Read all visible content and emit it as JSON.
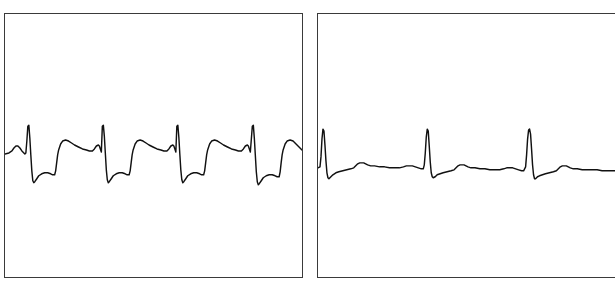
{
  "figure": {
    "type": "ecg-comparison-figure",
    "background_color": "#ffffff",
    "panel_border_color": "#3a3a3a",
    "trace_color": "#111111",
    "panel_count": 2
  },
  "panels": [
    {
      "id": "left",
      "name": "ecg-strip-left",
      "rhythm_label": "",
      "beat_count": 4,
      "frame": {
        "x": 4,
        "y": 13,
        "width": 299,
        "height": 265
      }
    },
    {
      "id": "right",
      "name": "ecg-strip-right",
      "rhythm_label": "",
      "beat_count": 3,
      "frame": {
        "x": 317,
        "y": 13,
        "width": 299,
        "height": 265
      }
    }
  ],
  "chart_data": [
    {
      "type": "line",
      "id": "ecg-left",
      "title": "",
      "xlabel": "",
      "ylabel": "",
      "grid": false,
      "legend": false,
      "xlim": [
        0,
        299
      ],
      "ylim": [
        0,
        265
      ],
      "baseline_y": 140,
      "beat_interval_px": 75,
      "r_peak_x": [
        23,
        98,
        173,
        249
      ],
      "r_peak_y": 113,
      "s_trough_y": 170,
      "t_peak_y": 128,
      "series": [
        {
          "name": "ecg-waveform-left",
          "points": [
            [
              0,
              141
            ],
            [
              4,
              140
            ],
            [
              7,
              138
            ],
            [
              9,
              135
            ],
            [
              11,
              133
            ],
            [
              13,
              133
            ],
            [
              15,
              135
            ],
            [
              17,
              138
            ],
            [
              19,
              140
            ],
            [
              20,
              141
            ],
            [
              21,
              140
            ],
            [
              22,
              128
            ],
            [
              23,
              113
            ],
            [
              24,
              112
            ],
            [
              25,
              125
            ],
            [
              26,
              142
            ],
            [
              27,
              158
            ],
            [
              28,
              168
            ],
            [
              29,
              170
            ],
            [
              30,
              169
            ],
            [
              32,
              166
            ],
            [
              34,
              163
            ],
            [
              37,
              161
            ],
            [
              40,
              160
            ],
            [
              43,
              160
            ],
            [
              46,
              161
            ],
            [
              48,
              162
            ],
            [
              50,
              162
            ],
            [
              51,
              158
            ],
            [
              52,
              150
            ],
            [
              53,
              142
            ],
            [
              54,
              137
            ],
            [
              56,
              131
            ],
            [
              58,
              128
            ],
            [
              61,
              127
            ],
            [
              64,
              128
            ],
            [
              67,
              130
            ],
            [
              70,
              132
            ],
            [
              74,
              134
            ],
            [
              78,
              136
            ],
            [
              82,
              137
            ],
            [
              85,
              138
            ],
            [
              88,
              138
            ],
            [
              90,
              136
            ],
            [
              92,
              133
            ],
            [
              94,
              132
            ],
            [
              95,
              133
            ],
            [
              96,
              136
            ],
            [
              97,
              139
            ],
            [
              98,
              113
            ],
            [
              99,
              112
            ],
            [
              100,
              123
            ],
            [
              101,
              140
            ],
            [
              102,
              157
            ],
            [
              103,
              167
            ],
            [
              104,
              170
            ],
            [
              105,
              169
            ],
            [
              107,
              166
            ],
            [
              109,
              163
            ],
            [
              112,
              161
            ],
            [
              115,
              160
            ],
            [
              118,
              160
            ],
            [
              121,
              161
            ],
            [
              123,
              162
            ],
            [
              125,
              162
            ],
            [
              126,
              158
            ],
            [
              127,
              150
            ],
            [
              128,
              142
            ],
            [
              129,
              137
            ],
            [
              131,
              131
            ],
            [
              133,
              128
            ],
            [
              136,
              127
            ],
            [
              139,
              128
            ],
            [
              142,
              130
            ],
            [
              145,
              132
            ],
            [
              149,
              134
            ],
            [
              153,
              136
            ],
            [
              157,
              137
            ],
            [
              160,
              138
            ],
            [
              163,
              138
            ],
            [
              165,
              136
            ],
            [
              167,
              133
            ],
            [
              169,
              132
            ],
            [
              170,
              133
            ],
            [
              171,
              136
            ],
            [
              172,
              139
            ],
            [
              173,
              113
            ],
            [
              174,
              112
            ],
            [
              175,
              124
            ],
            [
              176,
              141
            ],
            [
              177,
              157
            ],
            [
              178,
              167
            ],
            [
              179,
              170
            ],
            [
              180,
              169
            ],
            [
              182,
              166
            ],
            [
              184,
              163
            ],
            [
              187,
              161
            ],
            [
              190,
              160
            ],
            [
              193,
              160
            ],
            [
              196,
              161
            ],
            [
              198,
              162
            ],
            [
              200,
              162
            ],
            [
              201,
              158
            ],
            [
              202,
              150
            ],
            [
              203,
              142
            ],
            [
              204,
              137
            ],
            [
              206,
              131
            ],
            [
              208,
              128
            ],
            [
              211,
              127
            ],
            [
              214,
              128
            ],
            [
              217,
              130
            ],
            [
              220,
              132
            ],
            [
              224,
              134
            ],
            [
              228,
              136
            ],
            [
              232,
              137
            ],
            [
              235,
              138
            ],
            [
              238,
              138
            ],
            [
              240,
              136
            ],
            [
              242,
              133
            ],
            [
              244,
              132
            ],
            [
              245,
              133
            ],
            [
              246,
              136
            ],
            [
              247,
              139
            ],
            [
              249,
              113
            ],
            [
              250,
              112
            ],
            [
              251,
              125
            ],
            [
              252,
              142
            ],
            [
              253,
              159
            ],
            [
              254,
              169
            ],
            [
              255,
              172
            ],
            [
              256,
              171
            ],
            [
              258,
              168
            ],
            [
              260,
              165
            ],
            [
              263,
              163
            ],
            [
              266,
              162
            ],
            [
              269,
              162
            ],
            [
              272,
              163
            ],
            [
              274,
              164
            ],
            [
              276,
              164
            ],
            [
              277,
              159
            ],
            [
              278,
              150
            ],
            [
              279,
              142
            ],
            [
              280,
              137
            ],
            [
              282,
              131
            ],
            [
              284,
              128
            ],
            [
              287,
              127
            ],
            [
              290,
              128
            ],
            [
              293,
              131
            ],
            [
              296,
              134
            ],
            [
              299,
              137
            ]
          ]
        }
      ]
    },
    {
      "type": "line",
      "id": "ecg-right",
      "title": "",
      "xlabel": "",
      "ylabel": "",
      "grid": false,
      "legend": false,
      "xlim": [
        0,
        299
      ],
      "ylim": [
        0,
        265
      ],
      "baseline_y": 155,
      "beat_interval_px": 104,
      "r_peak_x": [
        5,
        110,
        213
      ],
      "r_peak_y": 116,
      "s_trough_y": 166,
      "t_peak_y": 147,
      "series": [
        {
          "name": "ecg-waveform-right",
          "points": [
            [
              0,
              155
            ],
            [
              2,
              154
            ],
            [
              3,
              144
            ],
            [
              4,
              126
            ],
            [
              5,
              116
            ],
            [
              6,
              118
            ],
            [
              7,
              132
            ],
            [
              8,
              148
            ],
            [
              9,
              160
            ],
            [
              10,
              165
            ],
            [
              11,
              166
            ],
            [
              13,
              164
            ],
            [
              15,
              162
            ],
            [
              18,
              160
            ],
            [
              21,
              159
            ],
            [
              25,
              158
            ],
            [
              29,
              157
            ],
            [
              33,
              156
            ],
            [
              36,
              155
            ],
            [
              38,
              153
            ],
            [
              40,
              151
            ],
            [
              42,
              150
            ],
            [
              44,
              150
            ],
            [
              46,
              150
            ],
            [
              48,
              151
            ],
            [
              50,
              152
            ],
            [
              53,
              153
            ],
            [
              57,
              153
            ],
            [
              62,
              154
            ],
            [
              67,
              154
            ],
            [
              72,
              155
            ],
            [
              77,
              155
            ],
            [
              82,
              155
            ],
            [
              86,
              154
            ],
            [
              89,
              153
            ],
            [
              92,
              153
            ],
            [
              95,
              153
            ],
            [
              98,
              154
            ],
            [
              101,
              155
            ],
            [
              104,
              156
            ],
            [
              106,
              156
            ],
            [
              107,
              152
            ],
            [
              108,
              140
            ],
            [
              109,
              124
            ],
            [
              110,
              116
            ],
            [
              111,
              118
            ],
            [
              112,
              133
            ],
            [
              113,
              149
            ],
            [
              114,
              160
            ],
            [
              115,
              164
            ],
            [
              116,
              165
            ],
            [
              118,
              164
            ],
            [
              120,
              162
            ],
            [
              123,
              161
            ],
            [
              126,
              160
            ],
            [
              130,
              159
            ],
            [
              134,
              158
            ],
            [
              137,
              157
            ],
            [
              139,
              155
            ],
            [
              141,
              153
            ],
            [
              143,
              152
            ],
            [
              145,
              152
            ],
            [
              147,
              152
            ],
            [
              149,
              153
            ],
            [
              151,
              154
            ],
            [
              154,
              155
            ],
            [
              158,
              155
            ],
            [
              163,
              156
            ],
            [
              168,
              156
            ],
            [
              173,
              157
            ],
            [
              178,
              157
            ],
            [
              183,
              157
            ],
            [
              187,
              156
            ],
            [
              190,
              155
            ],
            [
              193,
              155
            ],
            [
              196,
              155
            ],
            [
              199,
              156
            ],
            [
              202,
              157
            ],
            [
              205,
              158
            ],
            [
              207,
              158
            ],
            [
              209,
              154
            ],
            [
              210,
              142
            ],
            [
              211,
              126
            ],
            [
              212,
              117
            ],
            [
              213,
              116
            ],
            [
              214,
              121
            ],
            [
              215,
              136
            ],
            [
              216,
              152
            ],
            [
              217,
              162
            ],
            [
              218,
              166
            ],
            [
              219,
              166
            ],
            [
              221,
              164
            ],
            [
              223,
              163
            ],
            [
              226,
              162
            ],
            [
              229,
              161
            ],
            [
              233,
              160
            ],
            [
              237,
              159
            ],
            [
              240,
              158
            ],
            [
              242,
              156
            ],
            [
              244,
              154
            ],
            [
              246,
              153
            ],
            [
              248,
              153
            ],
            [
              250,
              153
            ],
            [
              252,
              154
            ],
            [
              254,
              155
            ],
            [
              257,
              156
            ],
            [
              261,
              156
            ],
            [
              266,
              157
            ],
            [
              271,
              157
            ],
            [
              276,
              157
            ],
            [
              281,
              157
            ],
            [
              286,
              158
            ],
            [
              291,
              158
            ],
            [
              295,
              158
            ],
            [
              299,
              158
            ]
          ]
        }
      ]
    }
  ]
}
